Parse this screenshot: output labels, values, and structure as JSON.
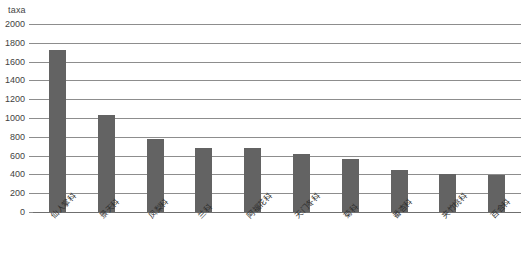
{
  "chart_data": {
    "type": "bar",
    "title": "taxa",
    "subtitle": "",
    "xlabel": "",
    "ylabel": "taxa",
    "ylim": [
      0,
      2000
    ],
    "ytick_step": 200,
    "yticks": [
      "2000",
      "1800",
      "1600",
      "1400",
      "1200",
      "1000",
      "800",
      "600",
      "400",
      "200",
      "0"
    ],
    "grid": true,
    "legend": "none",
    "bar_color": "#636363",
    "grid_color": "#8d8d8d",
    "categories": [
      "仙人掌科",
      "景天科",
      "凤梨科",
      "兰科",
      "阿福花科",
      "天门冬科",
      "菊科",
      "番杏科",
      "夹竹桃科",
      "百合科"
    ],
    "values": [
      1720,
      1030,
      780,
      680,
      680,
      620,
      560,
      450,
      400,
      390
    ],
    "series": [
      {
        "name": "taxa",
        "values": [
          1720,
          1030,
          780,
          680,
          680,
          620,
          560,
          450,
          400,
          390
        ]
      }
    ]
  },
  "axis": {
    "unit_caption": "taxa"
  }
}
